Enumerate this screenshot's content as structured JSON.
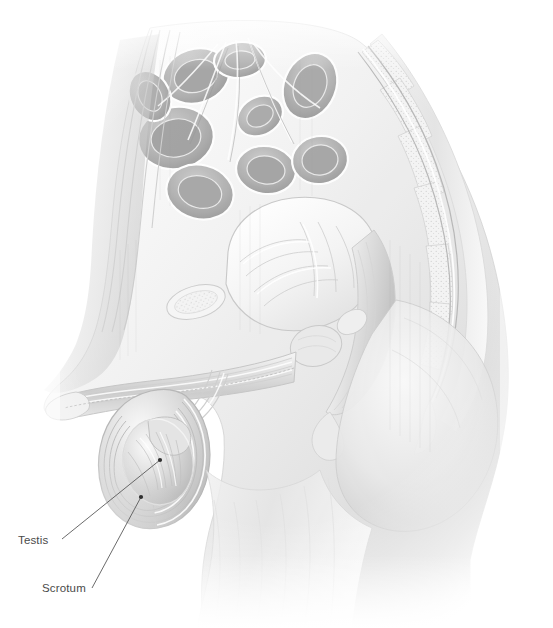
{
  "figure": {
    "style": "grayscale-pencil-medical-illustration",
    "background_color": "#ffffff",
    "line_color": "#5a5a5a",
    "label_color": "#4a4a4a"
  },
  "labels": [
    {
      "id": "testis",
      "text": "Testis",
      "text_x": 18,
      "text_y": 535,
      "leader_start_x": 62,
      "leader_start_y": 539,
      "leader_end_x": 160,
      "leader_end_y": 460,
      "marker": "dot"
    },
    {
      "id": "scrotum",
      "text": "Scrotum",
      "text_x": 42,
      "text_y": 583,
      "leader_start_x": 92,
      "leader_start_y": 588,
      "leader_end_x": 141,
      "leader_end_y": 497,
      "marker": "dot"
    }
  ],
  "structures": [
    {
      "id": "small-intestine",
      "name": "small intestine loops"
    },
    {
      "id": "vertebral-column",
      "name": "lumbar vertebrae and sacrum"
    },
    {
      "id": "urinary-bladder",
      "name": "urinary bladder"
    },
    {
      "id": "rectum",
      "name": "rectum"
    },
    {
      "id": "prostate",
      "name": "prostate gland"
    },
    {
      "id": "penis",
      "name": "penis, sagittal section"
    },
    {
      "id": "scrotum",
      "name": "scrotum"
    },
    {
      "id": "testis",
      "name": "testis"
    },
    {
      "id": "gluteal-region",
      "name": "gluteal region"
    },
    {
      "id": "thigh",
      "name": "thigh"
    },
    {
      "id": "abdominal-wall",
      "name": "anterior abdominal wall"
    },
    {
      "id": "pubic-symphysis",
      "name": "pubic symphysis"
    }
  ],
  "palette": {
    "mid_gray": "#b4b4b4",
    "dark_gray": "#8a8a8a",
    "shadow_gray": "#6f6f6f",
    "light_gray": "#dcdcdc",
    "pale_gray": "#eeeeee",
    "highlight": "#ffffff"
  }
}
